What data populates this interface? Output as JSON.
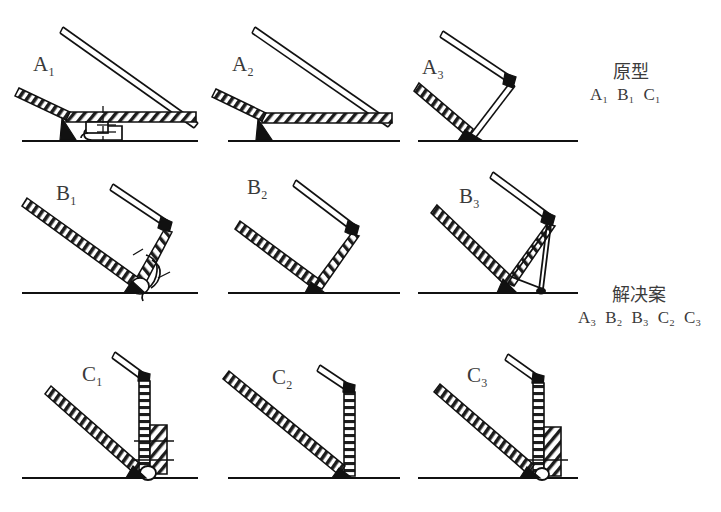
{
  "figure": {
    "type": "diagram",
    "title": "",
    "rows": [
      "A",
      "B",
      "C"
    ],
    "ground_line": "horizontal baseline under each panel"
  },
  "panels": [
    {
      "id": "A1",
      "label": "A",
      "sub": "1",
      "row": 0,
      "col": 0,
      "state": "shallow-open",
      "detail": "latch/roller catch under hatched horizontal bar"
    },
    {
      "id": "A2",
      "label": "A",
      "sub": "2",
      "row": 0,
      "col": 1,
      "state": "shallow-open",
      "detail": "plain hatched horizontal bar, no catch"
    },
    {
      "id": "A3",
      "label": "A",
      "sub": "3",
      "row": 0,
      "col": 2,
      "state": "shallow-open",
      "detail": "short strut from elbow to ground pivot"
    },
    {
      "id": "B1",
      "label": "B",
      "sub": "1",
      "row": 1,
      "col": 0,
      "state": "mid-open",
      "detail": "hinge with roller catch at foot"
    },
    {
      "id": "B2",
      "label": "B",
      "sub": "2",
      "row": 1,
      "col": 1,
      "state": "mid-open",
      "detail": "plain folded hinge at foot"
    },
    {
      "id": "B3",
      "label": "B",
      "sub": "3",
      "row": 1,
      "col": 2,
      "state": "mid-open",
      "detail": "triangular brace from elbow to ground"
    },
    {
      "id": "C1",
      "label": "C",
      "sub": "1",
      "row": 2,
      "col": 0,
      "state": "steep-open",
      "detail": "vertical post with stacked hatched block and pins"
    },
    {
      "id": "C2",
      "label": "C",
      "sub": "2",
      "row": 2,
      "col": 1,
      "state": "steep-open",
      "detail": "plain vertical post"
    },
    {
      "id": "C3",
      "label": "C",
      "sub": "3",
      "row": 2,
      "col": 2,
      "state": "steep-open",
      "detail": "vertical post with hatched block and cross pin"
    }
  ],
  "annotations": {
    "prototype": {
      "title": "原型",
      "items": [
        "A₁",
        "B₁",
        "C₁"
      ]
    },
    "solution": {
      "title": "解决案",
      "items": [
        "A₃",
        "B₂",
        "B₃",
        "C₂",
        "C₃"
      ]
    }
  }
}
